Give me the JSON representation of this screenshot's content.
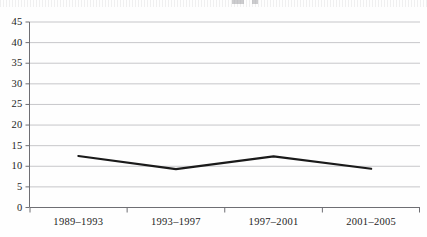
{
  "chart_data": {
    "type": "line",
    "title": "",
    "xlabel": "",
    "ylabel": "",
    "categories": [
      "1989–1993",
      "1993–1997",
      "1997–2001",
      "2001–2005"
    ],
    "values": [
      12.5,
      9.3,
      12.4,
      9.4
    ],
    "series": [
      {
        "name": "",
        "values": [
          12.5,
          9.3,
          12.4,
          9.4
        ]
      }
    ],
    "ylim": [
      0,
      45
    ],
    "ytick_labels": [
      "0",
      "5",
      "10",
      "15",
      "20",
      "25",
      "30",
      "35",
      "40",
      "45"
    ],
    "ytick_values": [
      0,
      5,
      10,
      15,
      20,
      25,
      30,
      35,
      40,
      45
    ],
    "grid": true,
    "grid_axis": "y",
    "legend": false,
    "legend_position": "none",
    "line_color": "#1a1a1a",
    "grid_color": "#b9b9bd",
    "axis_color": "#6e6e73",
    "background_color": "#fefefe",
    "markers": false
  }
}
